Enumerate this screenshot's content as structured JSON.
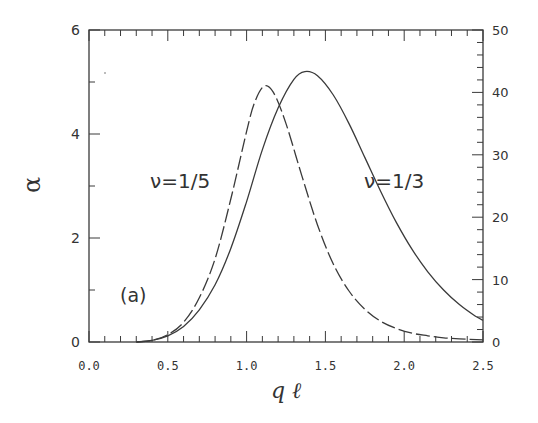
{
  "chart_data": {
    "type": "line",
    "title": "",
    "panel_label": "(a)",
    "xlabel": "q ℓ",
    "ylabel": "α",
    "xlim": [
      0.0,
      2.5
    ],
    "ylim": [
      0,
      6
    ],
    "y2lim": [
      0,
      50
    ],
    "grid": false,
    "legend": "inline annotations",
    "x_ticks": [
      "0.0",
      "0.5",
      "1.0",
      "1.5",
      "2.0",
      "2.5"
    ],
    "y_ticks": [
      "0",
      "2",
      "4",
      "6"
    ],
    "y2_ticks": [
      "0",
      "10",
      "20",
      "30",
      "40",
      "50"
    ],
    "series": [
      {
        "name": "ν=1/3",
        "style": "solid",
        "x": [
          0.3,
          0.4,
          0.5,
          0.6,
          0.7,
          0.8,
          0.9,
          1.0,
          1.1,
          1.2,
          1.3,
          1.37,
          1.45,
          1.55,
          1.65,
          1.75,
          1.85,
          1.95,
          2.05,
          2.15,
          2.25,
          2.35,
          2.45,
          2.5
        ],
        "values": [
          0.0,
          0.03,
          0.12,
          0.3,
          0.62,
          1.1,
          1.8,
          2.7,
          3.7,
          4.5,
          5.05,
          5.2,
          5.12,
          4.75,
          4.2,
          3.55,
          2.9,
          2.3,
          1.78,
          1.35,
          1.0,
          0.72,
          0.5,
          0.42
        ]
      },
      {
        "name": "ν=1/5",
        "style": "dashed",
        "x": [
          0.3,
          0.4,
          0.5,
          0.6,
          0.7,
          0.8,
          0.9,
          1.0,
          1.05,
          1.11,
          1.17,
          1.25,
          1.35,
          1.45,
          1.55,
          1.65,
          1.75,
          1.85,
          1.95,
          2.05,
          2.15,
          2.25,
          2.35,
          2.5
        ],
        "values": [
          0.0,
          0.03,
          0.14,
          0.38,
          0.85,
          1.6,
          2.75,
          4.05,
          4.6,
          4.92,
          4.8,
          4.2,
          3.2,
          2.25,
          1.5,
          0.98,
          0.63,
          0.4,
          0.26,
          0.17,
          0.12,
          0.08,
          0.06,
          0.04
        ]
      }
    ],
    "annotations": [
      {
        "text": "ν=1/5",
        "x": 0.58,
        "y": 3.45
      },
      {
        "text": "ν=1/3",
        "x": 1.8,
        "y": 3.45
      },
      {
        "text": "(a)",
        "x": 0.2,
        "y": 0.88
      }
    ]
  },
  "labels": {
    "panel": "(a)",
    "series_a": "ν=1/5",
    "series_b": "ν=1/3",
    "xlabel": "q ℓ",
    "ylabel": "α"
  }
}
